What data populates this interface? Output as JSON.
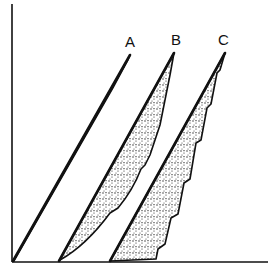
{
  "figure": {
    "type": "hysteresis-loops-diagram",
    "axes": {
      "x_axis": {
        "label": ""
      },
      "y_axis": {
        "label": ""
      }
    },
    "loops": [
      {
        "id": "A",
        "label": "A",
        "description": "very narrow loop, nearly a single line",
        "fill": "dense stipple"
      },
      {
        "id": "B",
        "label": "B",
        "description": "medium-width loop with curved, stepped right edge",
        "fill": "stipple"
      },
      {
        "id": "C",
        "label": "C",
        "description": "widest loop with sawtooth stepped right edge",
        "fill": "stipple"
      }
    ],
    "colors": {
      "line": "#111111",
      "background": "#ffffff",
      "stipple": "#222222"
    }
  }
}
